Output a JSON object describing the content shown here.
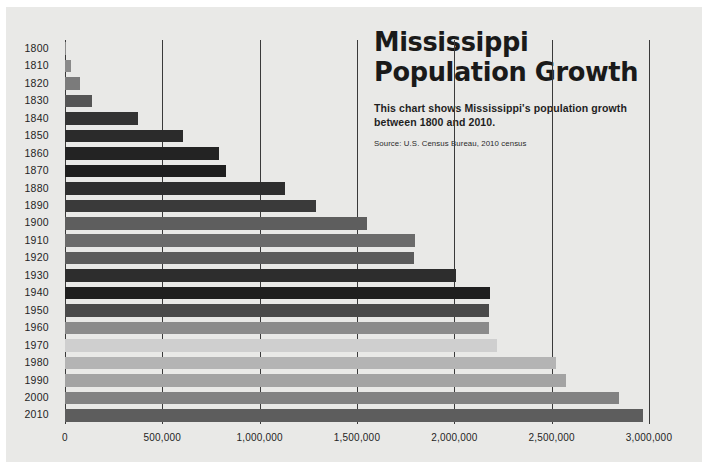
{
  "header": {
    "title_line1": "Mississippi",
    "title_line2": "Population Growth",
    "subtitle": "This chart shows Mississippi's population growth between 1800 and 2010.",
    "source": "Source: U.S. Census Bureau, 2010 census"
  },
  "palette": {
    "background": "#e9e9e7",
    "page": "#ffffff",
    "gridline": "#3a3a3a",
    "text": "#1f1f1f"
  },
  "chart_data": {
    "type": "bar",
    "orientation": "horizontal",
    "title": "Mississippi Population Growth",
    "subtitle": "This chart shows Mississippi's population growth between 1800 and 2010.",
    "source": "Source: U.S. Census Bureau, 2010 census",
    "xlabel": "",
    "ylabel": "",
    "xlim": [
      0,
      3000000
    ],
    "grid": true,
    "gridline_values": [
      0,
      500000,
      1000000,
      1500000,
      2000000,
      2500000,
      3000000
    ],
    "xticks": [
      0,
      500000,
      1000000,
      1500000,
      2000000,
      2500000,
      3000000
    ],
    "xtick_labels": [
      "0",
      "500,000",
      "1,000,000",
      "1,500,000",
      "2,000,000",
      "2,500,000",
      "3,000,000"
    ],
    "categories": [
      "1800",
      "1810",
      "1820",
      "1830",
      "1840",
      "1850",
      "1860",
      "1870",
      "1880",
      "1890",
      "1900",
      "1910",
      "1920",
      "1930",
      "1940",
      "1950",
      "1960",
      "1970",
      "1980",
      "1990",
      "2000",
      "2010"
    ],
    "values": [
      7600,
      31306,
      75448,
      136621,
      375651,
      606526,
      791305,
      827922,
      1131597,
      1289600,
      1551270,
      1797114,
      1790618,
      2009821,
      2183796,
      2178914,
      2178141,
      2216912,
      2520638,
      2573216,
      2844658,
      2967297
    ],
    "bar_colors": [
      "#8c8c8c",
      "#8a8a8a",
      "#7b7b7b",
      "#555555",
      "#333333",
      "#2b2b2b",
      "#232323",
      "#1e1e1e",
      "#2e2e2e",
      "#3a3a3a",
      "#5e5e5e",
      "#6b6b6b",
      "#5c5c5c",
      "#2d2d2d",
      "#1f1f1f",
      "#4a4a4a",
      "#8b8b8b",
      "#cfcfcf",
      "#b4b4b4",
      "#a3a3a3",
      "#828282",
      "#5d5d5d"
    ]
  }
}
